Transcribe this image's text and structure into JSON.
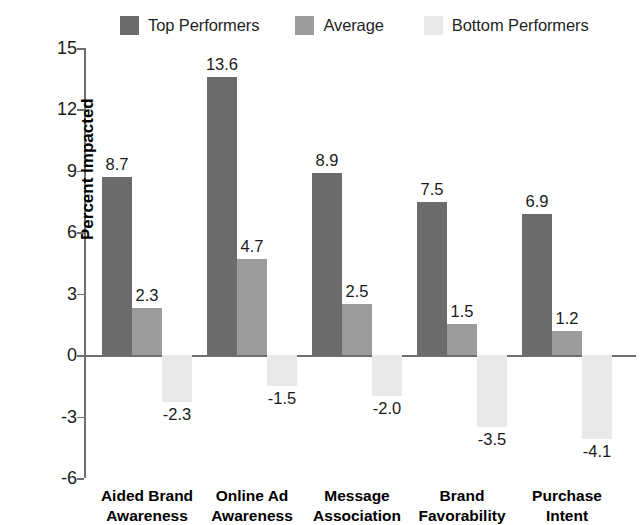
{
  "chart_data": {
    "type": "bar",
    "title": "",
    "xlabel": "",
    "ylabel": "Percent Impacted",
    "ylim": [
      -6,
      15
    ],
    "ytick_labels": [
      "15",
      "12",
      "9",
      "6",
      "3",
      "0",
      "-3",
      "-6"
    ],
    "ytick_values": [
      15,
      12,
      9,
      6,
      3,
      0,
      -3,
      -6
    ],
    "grid": false,
    "legend_position": "top",
    "categories": [
      "Aided Brand Awareness",
      "Online Ad Awareness",
      "Message Association",
      "Brand Favorability",
      "Purchase Intent"
    ],
    "category_lines": [
      [
        "Aided Brand",
        "Awareness"
      ],
      [
        "Online Ad",
        "Awareness"
      ],
      [
        "Message",
        "Association"
      ],
      [
        "Brand",
        "Favorability"
      ],
      [
        "Purchase",
        "Intent"
      ]
    ],
    "series": [
      {
        "name": "Top Performers",
        "color": "#6b6b6b",
        "values": [
          8.7,
          13.6,
          8.9,
          7.5,
          6.9
        ],
        "labels": [
          "8.7",
          "13.6",
          "8.9",
          "7.5",
          "6.9"
        ]
      },
      {
        "name": "Average",
        "color": "#9c9c9c",
        "values": [
          2.3,
          4.7,
          2.5,
          1.5,
          1.2
        ],
        "labels": [
          "2.3",
          "4.7",
          "2.5",
          "1.5",
          "1.2"
        ]
      },
      {
        "name": "Bottom Performers",
        "color": "#e9e9e9",
        "values": [
          -2.3,
          -1.5,
          -2.0,
          -3.5,
          -4.1
        ],
        "labels": [
          "-2.3",
          "-1.5",
          "-2.0",
          "-3.5",
          "-4.1"
        ]
      }
    ]
  },
  "legend": {
    "items": [
      {
        "label": "Top Performers",
        "color": "#6b6b6b"
      },
      {
        "label": "Average",
        "color": "#9c9c9c"
      },
      {
        "label": "Bottom Performers",
        "color": "#e9e9e9"
      }
    ]
  },
  "axis": {
    "y_title": "Percent Impacted"
  },
  "colors": {
    "axis": "#6e6e6e",
    "text": "#1a1a1a",
    "background": "#ffffff"
  }
}
